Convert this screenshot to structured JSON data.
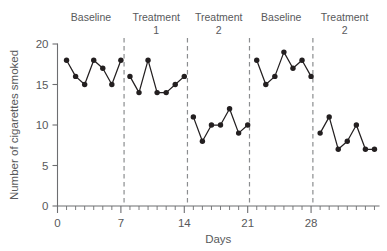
{
  "chart_data": {
    "type": "line",
    "title": "",
    "xlabel": "Days",
    "ylabel": "Number of cigarettes smoked",
    "xlim": [
      0,
      35.5
    ],
    "ylim": [
      0,
      20
    ],
    "grid": false,
    "legend": "none",
    "y_ticks": [
      0,
      5,
      10,
      15,
      20
    ],
    "y_tick_labels": [
      "0",
      "5",
      "10",
      "15",
      "20"
    ],
    "x_ticks": [
      0,
      7,
      14,
      21,
      28
    ],
    "x_tick_labels": [
      "0",
      "7",
      "14",
      "21",
      "28"
    ],
    "x_minor_tick_step": 1,
    "marker": "filled-circle",
    "line_color": "#231f20",
    "marker_color": "#231f20",
    "axis_color": "#6d6e71",
    "divider_color": "#8b8d8f",
    "divider_style": "dashed",
    "phase_dividers_x": [
      7.35,
      14.35,
      21.2,
      28.2
    ],
    "phases": [
      {
        "label_line1": "Baseline",
        "label_line2": "",
        "center_x": 3.7,
        "x": [
          1,
          2,
          3,
          4,
          5,
          6,
          7
        ],
        "values": [
          18,
          16,
          15,
          18,
          17,
          15,
          18
        ]
      },
      {
        "label_line1": "Treatment",
        "label_line2": "1",
        "center_x": 10.9,
        "x": [
          8,
          9,
          10,
          11,
          12,
          13,
          14
        ],
        "values": [
          16,
          14,
          18,
          14,
          14,
          15,
          16
        ]
      },
      {
        "label_line1": "Treatment",
        "label_line2": "2",
        "center_x": 17.8,
        "x": [
          15,
          16,
          17,
          18,
          19,
          20,
          21
        ],
        "values": [
          11,
          8,
          10,
          10,
          12,
          9,
          10
        ]
      },
      {
        "label_line1": "Baseline",
        "label_line2": "",
        "center_x": 24.7,
        "x": [
          22,
          23,
          24,
          25,
          26,
          27,
          28
        ],
        "values": [
          18,
          15,
          16,
          19,
          17,
          18,
          16
        ]
      },
      {
        "label_line1": "Treatment",
        "label_line2": "2",
        "center_x": 31.7,
        "x": [
          29,
          30,
          31,
          32,
          33,
          34,
          35
        ],
        "values": [
          9,
          11,
          7,
          8,
          10,
          7,
          7
        ]
      }
    ],
    "series": [
      {
        "name": "Cigarettes smoked",
        "x": [
          1,
          2,
          3,
          4,
          5,
          6,
          7,
          8,
          9,
          10,
          11,
          12,
          13,
          14,
          15,
          16,
          17,
          18,
          19,
          20,
          21,
          22,
          23,
          24,
          25,
          26,
          27,
          28,
          29,
          30,
          31,
          32,
          33,
          34,
          35
        ],
        "values": [
          18,
          16,
          15,
          18,
          17,
          15,
          18,
          16,
          14,
          18,
          14,
          14,
          15,
          16,
          11,
          8,
          10,
          10,
          12,
          9,
          10,
          18,
          15,
          16,
          19,
          17,
          18,
          16,
          9,
          11,
          7,
          8,
          10,
          7,
          7
        ]
      }
    ]
  }
}
